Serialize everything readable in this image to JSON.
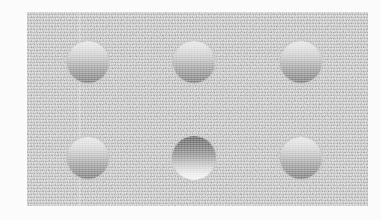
{
  "figure": {
    "width": 381,
    "height": 220,
    "margin_color": "#fbfbfb"
  },
  "panel": {
    "name": "stimulus-panel",
    "left": 27,
    "top": 12,
    "width": 341,
    "height": 194,
    "background_color": "#c9c9c9",
    "texture": "noise-grain",
    "seam_x": 52
  },
  "legend": {
    "convex_label": "convex (bump)",
    "concave_label": "concave (dimple)",
    "light_direction": "from above"
  },
  "palette": {
    "background_gray": "#c9c9c9",
    "convex_highlight": "#ececec",
    "convex_shadow": "#919191",
    "concave_shadow": "#7c7c7c",
    "concave_highlight": "#f6f6f6",
    "page_white": "#fbfbfb"
  },
  "discs": [
    {
      "id": "disc-1",
      "row": 1,
      "col": 1,
      "cx": 88,
      "cy": 62,
      "diameter": 42,
      "shading": "convex",
      "percept": "bump",
      "top_value": "#ececec",
      "bottom_value": "#919191"
    },
    {
      "id": "disc-2",
      "row": 1,
      "col": 2,
      "cx": 194,
      "cy": 62,
      "diameter": 42,
      "shading": "convex",
      "percept": "bump",
      "top_value": "#ececec",
      "bottom_value": "#919191"
    },
    {
      "id": "disc-3",
      "row": 1,
      "col": 3,
      "cx": 301,
      "cy": 62,
      "diameter": 42,
      "shading": "convex",
      "percept": "bump",
      "top_value": "#ececec",
      "bottom_value": "#919191"
    },
    {
      "id": "disc-4",
      "row": 2,
      "col": 1,
      "cx": 88,
      "cy": 158,
      "diameter": 42,
      "shading": "convex",
      "percept": "bump",
      "top_value": "#ececec",
      "bottom_value": "#919191"
    },
    {
      "id": "disc-5",
      "row": 2,
      "col": 2,
      "cx": 194,
      "cy": 158,
      "diameter": 44,
      "shading": "concave",
      "percept": "dimple",
      "top_value": "#7c7c7c",
      "bottom_value": "#f6f6f6"
    },
    {
      "id": "disc-6",
      "row": 2,
      "col": 3,
      "cx": 301,
      "cy": 158,
      "diameter": 42,
      "shading": "convex",
      "percept": "bump",
      "top_value": "#ececec",
      "bottom_value": "#919191"
    }
  ]
}
